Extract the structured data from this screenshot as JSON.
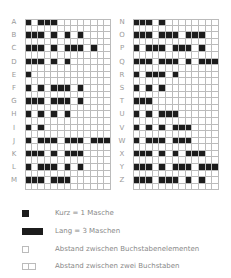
{
  "chart_data": {
    "type": "table",
    "columns": 13,
    "left_panel": [
      {
        "letter": "A",
        "code": ".-"
      },
      {
        "letter": "B",
        "code": "-..."
      },
      {
        "letter": "C",
        "code": "-.-."
      },
      {
        "letter": "D",
        "code": "-.."
      },
      {
        "letter": "E",
        "code": "."
      },
      {
        "letter": "F",
        "code": "..-."
      },
      {
        "letter": "G",
        "code": "--."
      },
      {
        "letter": "H",
        "code": "...."
      },
      {
        "letter": "I",
        "code": ".."
      },
      {
        "letter": "J",
        "code": ".---"
      },
      {
        "letter": "K",
        "code": "-.-"
      },
      {
        "letter": "L",
        "code": ".-.."
      },
      {
        "letter": "M",
        "code": "--"
      }
    ],
    "right_panel": [
      {
        "letter": "N",
        "code": "-."
      },
      {
        "letter": "O",
        "code": "---"
      },
      {
        "letter": "P",
        "code": ".--."
      },
      {
        "letter": "Q",
        "code": "--.-"
      },
      {
        "letter": "R",
        "code": ".-."
      },
      {
        "letter": "S",
        "code": "..."
      },
      {
        "letter": "T",
        "code": "-"
      },
      {
        "letter": "U",
        "code": "..-"
      },
      {
        "letter": "V",
        "code": "...-"
      },
      {
        "letter": "W",
        "code": ".--"
      },
      {
        "letter": "X",
        "code": "-..-"
      },
      {
        "letter": "Y",
        "code": "-.--"
      },
      {
        "letter": "Z",
        "code": "--.."
      }
    ],
    "colors": {
      "filled": "#1c1c1c",
      "grid": "#bbbbbb",
      "label": "#999999"
    }
  },
  "legend": {
    "items": [
      {
        "symbol": "short",
        "cells": [
          1
        ],
        "text": "Kurz = 1 Masche"
      },
      {
        "symbol": "long",
        "cells": [
          1,
          1,
          1
        ],
        "text": "Lang = 3 Maschen"
      },
      {
        "symbol": "element-gap",
        "cells": [
          0
        ],
        "text": "Abstand zwischen Buchstabenelementen"
      },
      {
        "symbol": "letter-gap",
        "cells": [
          0,
          0
        ],
        "text": "Abstand zwischen zwei Buchstaben"
      }
    ]
  }
}
